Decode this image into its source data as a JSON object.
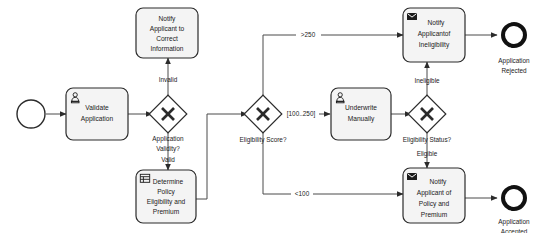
{
  "diagram": {
    "type": "bpmn-process",
    "background_color": "#ffffff",
    "shape_fill": "#f4f4f4",
    "stroke_color": "#2b2b2b"
  },
  "events": {
    "start": {
      "label": "",
      "name": "start-event"
    },
    "end_rejected": {
      "label_line1": "Application",
      "label_line2": "Rejected"
    },
    "end_accepted": {
      "label_line1": "Application",
      "label_line2": "Accepted"
    }
  },
  "tasks": [
    {
      "id": "validate-application",
      "icon": "user-icon",
      "lines": [
        "Validate",
        "Application"
      ]
    },
    {
      "id": "notify-correct-information",
      "icon": "none",
      "lines": [
        "Notify",
        "Applicant to",
        "Correct",
        "Information"
      ]
    },
    {
      "id": "determine-policy",
      "icon": "business-rule-icon",
      "lines": [
        "Determine",
        "Policy",
        "Eligibility and",
        "Premium"
      ]
    },
    {
      "id": "underwrite-manually",
      "icon": "user-icon",
      "lines": [
        "Underwrite",
        "Manually"
      ]
    },
    {
      "id": "notify-ineligibility",
      "icon": "envelope-icon",
      "lines": [
        "Notify",
        "Applicantof",
        "Ineligibility"
      ]
    },
    {
      "id": "notify-policy-premium",
      "icon": "envelope-icon",
      "lines": [
        "Notify",
        "Applicant of",
        "Policy and",
        "Premium"
      ]
    }
  ],
  "gateways": [
    {
      "id": "application-validity",
      "type": "exclusive",
      "label_line1": "Application",
      "label_line2": "Validity?"
    },
    {
      "id": "eligibility-score",
      "type": "exclusive",
      "label_line1": "Eligibility Score?",
      "label_line2": ""
    },
    {
      "id": "eligibility-status",
      "type": "exclusive",
      "label_line1": "Eligibility Status?",
      "label_line2": ""
    }
  ],
  "flows": [
    {
      "id": "flow-invalid",
      "label": "Invalid"
    },
    {
      "id": "flow-valid",
      "label": "Valid"
    },
    {
      "id": "flow-score-high",
      "label": ">250"
    },
    {
      "id": "flow-score-mid",
      "label": "[100..250]"
    },
    {
      "id": "flow-score-low",
      "label": "<100"
    },
    {
      "id": "flow-ineligible",
      "label": "Ineligible"
    },
    {
      "id": "flow-eligible",
      "label": "Eligible"
    }
  ]
}
